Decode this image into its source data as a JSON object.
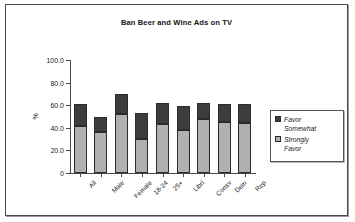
{
  "chart_data": {
    "type": "bar",
    "stacked": true,
    "title": "Ban Beer and Wine Ads on TV",
    "xlabel": "",
    "ylabel": "%",
    "ylim": [
      0,
      100
    ],
    "ytick_labels": [
      "0",
      "20.0",
      "40.0",
      "60.0",
      "80.0",
      "100.0"
    ],
    "ytick_values": [
      0,
      20,
      40,
      60,
      80,
      100
    ],
    "grid": false,
    "legend_position": "right",
    "categories": [
      "All",
      "Male",
      "Female",
      "18-24",
      "25+",
      "Librl",
      "Consv",
      "Dem",
      "Rep"
    ],
    "series": [
      {
        "name": "Strongly Favor",
        "color": "#b0b0b0",
        "values": [
          42,
          36,
          52,
          30,
          43,
          38,
          48,
          45,
          44
        ]
      },
      {
        "name": "Favor Somewhat",
        "color": "#3d3d3d",
        "values": [
          19,
          14,
          18,
          23,
          19,
          21,
          14,
          16,
          17
        ]
      }
    ],
    "totals": [
      61,
      50,
      70,
      53,
      62,
      59,
      62,
      61,
      61
    ]
  },
  "legend": {
    "items": [
      {
        "label_line1": "Favor",
        "label_line2": "Somewhat",
        "swatch": "dark-swatch-icon"
      },
      {
        "label_line1": "Strongly",
        "label_line2": "Favor",
        "swatch": "light-swatch-icon"
      }
    ]
  }
}
